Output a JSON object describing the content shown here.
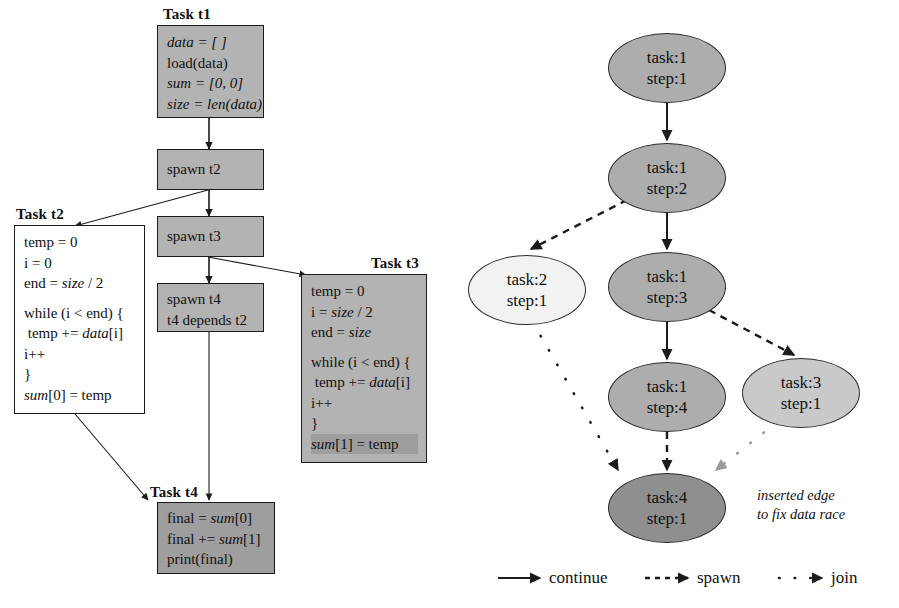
{
  "figure": {
    "left_panel": {
      "title_hidden": "",
      "tasks": [
        {
          "label": "Task t1",
          "fill": "#b3b3b3",
          "lines": [
            "data = [ ]",
            "load(data)",
            "sum = [0, 0]",
            "size = len(data)"
          ]
        },
        {
          "label": "",
          "fill": "#b3b3b3",
          "lines": [
            "spawn t2"
          ]
        },
        {
          "label": "",
          "fill": "#b3b3b3",
          "lines": [
            "spawn t3"
          ]
        },
        {
          "label": "",
          "fill": "#b3b3b3",
          "lines": [
            "spawn t4",
            "t4 depends t2"
          ]
        },
        {
          "label": "Task t2",
          "fill": "#ffffff",
          "lines": [
            "temp = 0",
            "i = 0",
            "end = size / 2",
            "",
            "while (i < end) {",
            "  temp += data[i]",
            "  i++",
            "}",
            "sum[0] = temp"
          ]
        },
        {
          "label": "Task t3",
          "fill": "#b3b3b3",
          "lines": [
            "temp = 0",
            "i = size / 2",
            "end = size",
            "",
            "while (i < end) {",
            "  temp += data[i]",
            "  i++",
            "}",
            "sum[1] = temp"
          ]
        },
        {
          "label": "Task t4",
          "fill": "#9e9e9e",
          "lines": [
            "final = sum[0]",
            "final += sum[1]",
            "print(final)"
          ]
        }
      ]
    },
    "right_panel": {
      "nodes": [
        {
          "task": "task:1",
          "step": "step:1",
          "fill": "#adadad"
        },
        {
          "task": "task:1",
          "step": "step:2",
          "fill": "#adadad"
        },
        {
          "task": "task:2",
          "step": "step:1",
          "fill": "#f2f2f2"
        },
        {
          "task": "task:1",
          "step": "step:3",
          "fill": "#adadad"
        },
        {
          "task": "task:1",
          "step": "step:4",
          "fill": "#adadad"
        },
        {
          "task": "task:3",
          "step": "step:1",
          "fill": "#c9c9c9"
        },
        {
          "task": "task:4",
          "step": "step:1",
          "fill": "#8f8f8f"
        }
      ],
      "annotation": {
        "line1": "inserted edge",
        "line2": "to fix data race"
      },
      "legend": [
        {
          "name": "continue",
          "style": "solid"
        },
        {
          "name": "spawn",
          "style": "dashed"
        },
        {
          "name": "join",
          "style": "dotted"
        }
      ]
    }
  },
  "colors": {
    "ink": "#111111",
    "box_border": "#1b1b1b",
    "node_border": "#2a2a2a",
    "gray_fill": "#b3b3b3",
    "dark_fill": "#8f8f8f",
    "inserted_edge": "#9a9a9a"
  }
}
